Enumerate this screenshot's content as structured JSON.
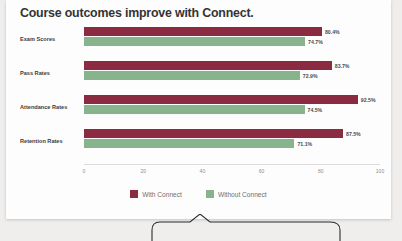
{
  "chart_data": {
    "type": "bar",
    "orientation": "horizontal",
    "title": "Course outcomes improve with Connect.",
    "categories": [
      "Exam Scores",
      "Pass Rates",
      "Attendance Rates",
      "Retention Rates"
    ],
    "series": [
      {
        "name": "With Connect",
        "color": "#8a2b41",
        "values": [
          80.4,
          83.7,
          92.5,
          87.5
        ],
        "labels": [
          "80.4%",
          "83.7%",
          "92.5%",
          "87.5%"
        ]
      },
      {
        "name": "Without Connect",
        "color": "#87b48d",
        "values": [
          74.7,
          72.9,
          74.5,
          71.1
        ],
        "labels": [
          "74.7%",
          "72.9%",
          "74.5%",
          "71.1%"
        ]
      }
    ],
    "xlabel": "",
    "ylabel": "",
    "xlim": [
      0,
      100
    ],
    "xticks": [
      0,
      20,
      40,
      60,
      80,
      100
    ],
    "xtick_labels": [
      "0",
      "20",
      "40",
      "60",
      "80",
      "100"
    ],
    "grid": false,
    "legend_position": "bottom"
  },
  "legend": {
    "items": [
      {
        "label": "With Connect",
        "color": "#8a2b41"
      },
      {
        "label": "Without Connect",
        "color": "#87b48d"
      }
    ]
  },
  "colors": {
    "with_connect": "#8a2b41",
    "without_connect": "#87b48d",
    "card_background": "#fdfdfd",
    "page_background": "#efeeec",
    "title_text": "#343434",
    "axis_text": "#8d8d8d"
  }
}
